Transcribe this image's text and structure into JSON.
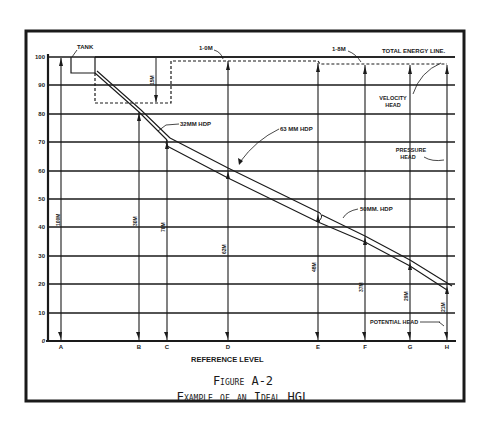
{
  "figure": {
    "number": "Figure A-2",
    "title": "Example of an Ideal HGL"
  },
  "axis": {
    "y_ticks": [
      "100",
      "90",
      "80",
      "70",
      "60",
      "50",
      "40",
      "30",
      "20",
      "10",
      "0"
    ],
    "x_label": "REFERENCE LEVEL",
    "stations": [
      "A",
      "B",
      "C",
      "D",
      "E",
      "F",
      "G",
      "H"
    ]
  },
  "labels": {
    "tank": "TANK",
    "total_energy_line": "TOTAL ENERGY LINE.",
    "velocity_head_1": "VELOCITY",
    "velocity_head_2": "HEAD",
    "pressure_head_1": "PRESSURE",
    "pressure_head_2": "HEAD",
    "potential_head": "POTENTIAL HEAD",
    "loss_1": "1·0M",
    "loss_2": "1·8M",
    "loss_tank": "15M",
    "pipe_32": "32MM HDP",
    "pipe_63": "63 MM HDP",
    "pipe_50": "50MM. HDP"
  },
  "station_heads": {
    "A": "100M",
    "B": "30M",
    "C": "70M",
    "D": "62M",
    "E": "48M",
    "F": "37M",
    "G": "29M",
    "H": "21M"
  },
  "colors": {
    "ink": "#1a1a1a",
    "paper": "#ffffff"
  }
}
